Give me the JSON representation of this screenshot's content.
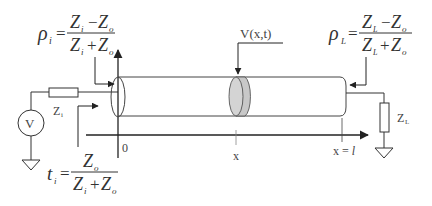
{
  "diagram": {
    "equations": {
      "rho_i": {
        "lhs": "ρ",
        "sub": "i",
        "numerator": "Zᵢ − Zₒ",
        "denominator": "Zᵢ + Zₒ",
        "num_a": "Z",
        "num_a_sub": "i",
        "num_op": "−",
        "num_b": "Z",
        "num_b_sub": "o",
        "den_a": "Z",
        "den_a_sub": "i",
        "den_op": "+",
        "den_b": "Z",
        "den_b_sub": "o"
      },
      "rho_L": {
        "lhs": "ρ",
        "sub": "L",
        "num_a": "Z",
        "num_a_sub": "L",
        "num_op": "−",
        "num_b": "Z",
        "num_b_sub": "o",
        "den_a": "Z",
        "den_a_sub": "L",
        "den_op": "+",
        "den_b": "Z",
        "den_b_sub": "o"
      },
      "t_i": {
        "lhs": "t",
        "sub": "i",
        "num_a": "Z",
        "num_a_sub": "o",
        "den_a": "Z",
        "den_a_sub": "i",
        "den_op": "+",
        "den_b": "Z",
        "den_b_sub": "o"
      }
    },
    "labels": {
      "wave": "V(x,t)",
      "source": "V",
      "source_impedance": "Z",
      "source_impedance_sub": "i",
      "load_impedance": "Z",
      "load_impedance_sub": "L",
      "origin": "0",
      "position": "x",
      "end": "x = ",
      "end_symbol": "l"
    },
    "colors": {
      "line": "#333333",
      "disk_fill": "#c8c8c8",
      "disk_front": "#d4d4d4"
    }
  }
}
